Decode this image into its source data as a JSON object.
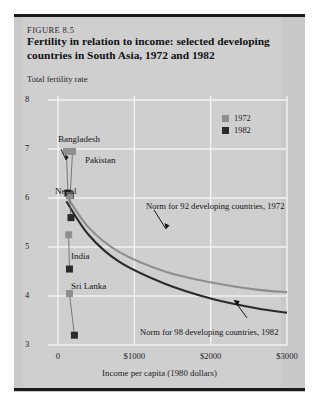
{
  "figure": {
    "number": "FIGURE 8.5",
    "title": "Fertility in relation to income: selected developing countries in South Asia, 1972 and 1982"
  },
  "colors": {
    "plate": "#c9c9c9",
    "panel": "#cfcfcf",
    "rule": "#1a1a1a",
    "grid": "#f2f2f2",
    "marker_1972": "#8e8e8e",
    "marker_1982": "#2a2a2a",
    "curve_1972": "#8e8e8e",
    "curve_1982": "#2a2a2a"
  },
  "chart_data": {
    "type": "scatter",
    "title": "Fertility in relation to income: selected developing countries in South Asia, 1972 and 1982",
    "xlabel": "Income per capita (1980 dollars)",
    "ylabel": "Total fertility rate",
    "xlim": [
      0,
      3000
    ],
    "ylim": [
      3,
      8
    ],
    "xticks": [
      0,
      1000,
      2000,
      3000
    ],
    "xticklabels": [
      "0",
      "$1000",
      "$2000",
      "$3000"
    ],
    "yticks": [
      3,
      4,
      5,
      6,
      7,
      8
    ],
    "yticklabels": [
      "3",
      "4",
      "5",
      "6",
      "7",
      "8"
    ],
    "grid": true,
    "legend_position": "top-right",
    "legend": [
      {
        "label": "1972",
        "color": "#8e8e8e"
      },
      {
        "label": "1982",
        "color": "#2a2a2a"
      }
    ],
    "countries": [
      {
        "name": "Bangladesh",
        "x_1972": 110,
        "y_1972": 6.95,
        "x_1982": 130,
        "y_1982": 6.1,
        "label_x": 1000,
        "label_y": 1000
      },
      {
        "name": "Pakistan",
        "x_1972": 190,
        "y_1972": 6.95,
        "x_1982": 160,
        "y_1982": 6.05
      },
      {
        "name": "Nepal",
        "x_1972": 150,
        "y_1972": 6.05,
        "x_1982": 170,
        "y_1982": 5.6
      },
      {
        "name": "India",
        "x_1972": 140,
        "y_1972": 5.25,
        "x_1982": 150,
        "y_1982": 4.55
      },
      {
        "name": "Sri Lanka",
        "x_1972": 150,
        "y_1972": 4.05,
        "x_1982": 215,
        "y_1982": 3.2
      }
    ],
    "norm_curves": [
      {
        "name": "Norm for 92 developing countries, 1972",
        "year": 1972,
        "color": "#8e8e8e",
        "points": [
          [
            110,
            6.05
          ],
          [
            400,
            5.4
          ],
          [
            800,
            4.9
          ],
          [
            1400,
            4.5
          ],
          [
            2000,
            4.28
          ],
          [
            2600,
            4.13
          ],
          [
            3000,
            4.08
          ]
        ]
      },
      {
        "name": "Norm for 98 developing countries, 1982",
        "year": 1982,
        "color": "#2a2a2a",
        "points": [
          [
            110,
            5.93
          ],
          [
            400,
            5.25
          ],
          [
            800,
            4.7
          ],
          [
            1400,
            4.25
          ],
          [
            2000,
            3.95
          ],
          [
            2600,
            3.75
          ],
          [
            3000,
            3.66
          ]
        ]
      }
    ],
    "annotations": [
      {
        "text": "Norm for 92 developing countries, 1972",
        "anchor_x": 1000,
        "anchor_y": 5.55
      },
      {
        "text": "Norm for 98 developing countries, 1982",
        "anchor_x": 1450,
        "anchor_y": 3.55
      }
    ]
  },
  "axis": {
    "y_title": "Total fertility rate",
    "x_title": "Income per capita (1980 dollars)"
  }
}
